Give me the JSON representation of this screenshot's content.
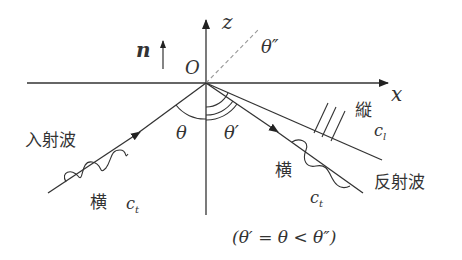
{
  "diagram": {
    "axes": {
      "z_label": "z",
      "x_label": "x",
      "origin_label": "O",
      "normal_label": "n"
    },
    "angles": {
      "incident": "θ",
      "reflected_transverse": "θ′",
      "reflected_longitudinal": "θ″"
    },
    "waves": {
      "incident": {
        "label": "入射波",
        "type": "横",
        "speed": "c",
        "speed_sub": "t"
      },
      "reflected_transverse": {
        "label": "反射波",
        "type": "横",
        "speed": "c",
        "speed_sub": "t"
      },
      "reflected_longitudinal": {
        "type": "縦",
        "speed": "c",
        "speed_sub": "l"
      }
    },
    "relation": "(θ′ = θ < θ″)",
    "colors": {
      "line": "#333333",
      "dashed": "#999999",
      "background": "#ffffff"
    }
  }
}
